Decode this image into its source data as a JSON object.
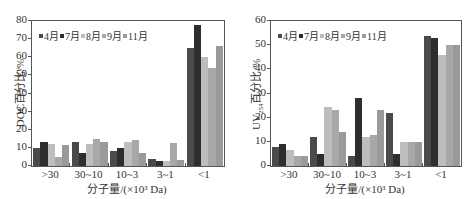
{
  "chart_data": [
    {
      "type": "bar",
      "title": "",
      "xlabel": "分子量/(×10³ Da)",
      "ylabel": "DOC百分比/%",
      "ylim": [
        0,
        80
      ],
      "yticks": [
        "0",
        "10",
        "20",
        "30",
        "40",
        "50",
        "60",
        "70",
        "80"
      ],
      "categories": [
        ">30",
        "30~10",
        "10~3",
        "3~1",
        "<1"
      ],
      "legend_position": "upper left",
      "series": [
        {
          "name": "4月",
          "color": "#4a4a4a",
          "values": [
            10,
            13,
            8.5,
            4,
            65
          ]
        },
        {
          "name": "7月",
          "color": "#2e2e2e",
          "values": [
            13,
            7,
            10,
            2.5,
            78
          ]
        },
        {
          "name": "8月",
          "color": "#bdbdbd",
          "values": [
            12,
            12,
            13,
            3,
            60
          ]
        },
        {
          "name": "9月",
          "color": "#a8a8a8",
          "values": [
            5,
            15,
            14.5,
            12.5,
            54
          ]
        },
        {
          "name": "11月",
          "color": "#9a9a9a",
          "values": [
            11.5,
            13,
            7,
            3.5,
            66
          ]
        }
      ]
    },
    {
      "type": "bar",
      "title": "",
      "xlabel": "分子量/(×10³ Da)",
      "ylabel": "UV254百分比/%",
      "ylim": [
        0,
        60
      ],
      "yticks": [
        "0",
        "10",
        "20",
        "30",
        "40",
        "50",
        "60"
      ],
      "categories": [
        ">30",
        "30~10",
        "10~3",
        "3~1",
        "<1"
      ],
      "legend_position": "upper left",
      "series": [
        {
          "name": "4月",
          "color": "#4a4a4a",
          "values": [
            8,
            12,
            4,
            22,
            54
          ]
        },
        {
          "name": "7月",
          "color": "#2e2e2e",
          "values": [
            9,
            5,
            28,
            5,
            53
          ]
        },
        {
          "name": "8月",
          "color": "#bdbdbd",
          "values": [
            6.5,
            24.5,
            12,
            10,
            46
          ]
        },
        {
          "name": "9月",
          "color": "#a8a8a8",
          "values": [
            4,
            23,
            13,
            10,
            50
          ]
        },
        {
          "name": "11月",
          "color": "#9a9a9a",
          "values": [
            4,
            14,
            23,
            10,
            50
          ]
        }
      ]
    }
  ],
  "left": {
    "ylabel": "DOC百分比/%",
    "xlabel": "分子量/(×10³ Da)"
  },
  "right": {
    "ylabel_main": "UV",
    "ylabel_sub": "254",
    "ylabel_rest": "百分比/%",
    "xlabel": "分子量/(×10³ Da)"
  }
}
